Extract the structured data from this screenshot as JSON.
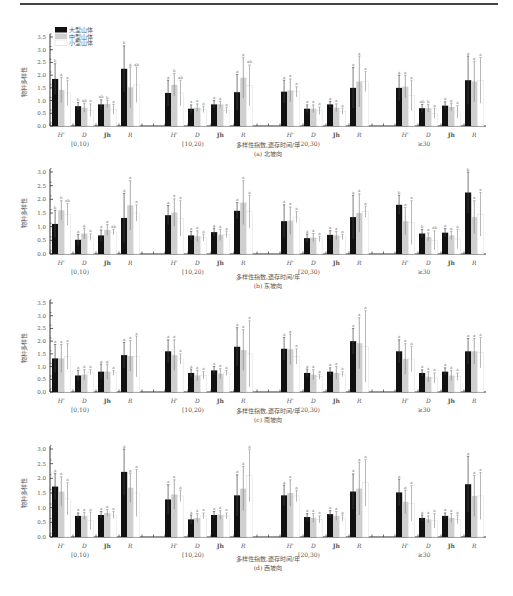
{
  "legend": {
    "items": [
      {
        "label": "大型山体",
        "color": "#111111"
      },
      {
        "label": "中型山体",
        "color": "#cfcfcf"
      },
      {
        "label": "小型山体",
        "color": "#ffffff"
      }
    ]
  },
  "chart_data": [
    {
      "type": "bar",
      "title": "(a) 北坡向",
      "xlabel": "多样性指数,遗存时间/年",
      "ylabel": "物种多样性",
      "ylim": [
        0,
        3.5
      ],
      "yticks": [
        "0.0",
        "0.5",
        "1.0",
        "1.5",
        "2.0",
        "2.5",
        "3.0",
        "3.5"
      ],
      "groups": [
        "[0,10)",
        "[10,20)",
        "[20,30)",
        "≥30"
      ],
      "categories": [
        "H'",
        "D",
        "Jh",
        "R"
      ],
      "series": [
        {
          "name": "大型山体",
          "values": [
            [
              1.85,
              0.78,
              0.85,
              2.25
            ],
            [
              1.3,
              0.68,
              0.85,
              1.33
            ],
            [
              1.35,
              0.68,
              0.85,
              1.5
            ],
            [
              1.5,
              0.7,
              0.8,
              1.8
            ]
          ],
          "errors": [
            [
              0.6,
              0.15,
              0.18,
              0.9
            ],
            [
              0.5,
              0.15,
              0.15,
              0.7
            ],
            [
              0.45,
              0.15,
              0.12,
              0.8
            ],
            [
              0.5,
              0.15,
              0.15,
              0.95
            ]
          ]
        },
        {
          "name": "中型山体",
          "values": [
            [
              1.42,
              0.72,
              0.87,
              1.52
            ],
            [
              1.62,
              0.72,
              0.85,
              1.9
            ],
            [
              1.4,
              0.68,
              0.72,
              1.75
            ],
            [
              1.55,
              0.7,
              0.75,
              1.75
            ]
          ],
          "errors": [
            [
              0.5,
              0.18,
              0.15,
              0.8
            ],
            [
              0.45,
              0.15,
              0.12,
              0.8
            ],
            [
              0.45,
              0.15,
              0.15,
              1.0
            ],
            [
              0.45,
              0.15,
              0.15,
              0.8
            ]
          ]
        },
        {
          "name": "小型山体",
          "values": [
            [
              1.3,
              0.62,
              0.65,
              1.62
            ],
            [
              1.3,
              0.65,
              0.62,
              1.6
            ],
            [
              1.35,
              0.6,
              0.58,
              1.75
            ],
            [
              1.2,
              0.5,
              0.55,
              1.8
            ]
          ],
          "errors": [
            [
              0.5,
              0.25,
              0.2,
              0.7
            ],
            [
              0.5,
              0.12,
              0.12,
              0.8
            ],
            [
              0.2,
              0.15,
              0.12,
              0.4
            ],
            [
              0.6,
              0.2,
              0.25,
              0.9
            ]
          ]
        }
      ],
      "significance": [
        [
          [
            "b",
            "a",
            "a"
          ],
          [
            "b",
            "ab",
            "a"
          ],
          [
            "ab",
            "b",
            "a"
          ],
          [
            "b",
            "a",
            "ab"
          ]
        ],
        [
          [
            "a",
            "b",
            "ab"
          ],
          [
            "a",
            "a",
            "a"
          ],
          [
            "a",
            "a",
            "a"
          ],
          [
            "a",
            "a",
            "ab"
          ]
        ],
        [
          [
            "a",
            "a",
            "a"
          ],
          [
            "a",
            "a",
            "a"
          ],
          [
            "a",
            "a",
            "a"
          ],
          [
            "a",
            "a",
            "a"
          ]
        ],
        [
          [
            "a",
            "a",
            "a"
          ],
          [
            "ab",
            "b",
            "a"
          ],
          [
            "a",
            "a",
            "a"
          ],
          [
            "a",
            "a",
            "a"
          ]
        ]
      ]
    },
    {
      "type": "bar",
      "title": "(b) 东坡向",
      "xlabel": "多样性指数,遗存时间/年",
      "ylabel": "物种多样性",
      "ylim": [
        0,
        3.0
      ],
      "yticks": [
        "0.0",
        "0.5",
        "1.0",
        "1.5",
        "2.0",
        "2.5",
        "3.0"
      ],
      "groups": [
        "[0,10)",
        "[10,20)",
        "[20,30)",
        "≥30"
      ],
      "categories": [
        "H'",
        "D",
        "Jh",
        "R"
      ],
      "series": [
        {
          "name": "大型山体",
          "values": [
            [
              1.1,
              0.52,
              0.68,
              1.32
            ],
            [
              1.42,
              0.68,
              0.8,
              1.58
            ],
            [
              1.2,
              0.58,
              0.7,
              1.35
            ],
            [
              1.8,
              0.75,
              0.78,
              2.25
            ]
          ],
          "errors": [
            [
              0.5,
              0.2,
              0.2,
              0.9
            ],
            [
              0.35,
              0.15,
              0.15,
              0.3
            ],
            [
              0.6,
              0.15,
              0.15,
              0.8
            ],
            [
              0.35,
              0.15,
              0.15,
              0.75
            ]
          ]
        },
        {
          "name": "中型山体",
          "values": [
            [
              1.6,
              0.75,
              0.88,
              1.78
            ],
            [
              1.52,
              0.65,
              0.7,
              1.88
            ],
            [
              1.22,
              0.6,
              0.68,
              1.5
            ],
            [
              1.2,
              0.62,
              0.68,
              1.35
            ]
          ],
          "errors": [
            [
              0.35,
              0.2,
              0.2,
              0.9
            ],
            [
              0.5,
              0.2,
              0.2,
              0.8
            ],
            [
              0.5,
              0.15,
              0.15,
              0.7
            ],
            [
              0.5,
              0.15,
              0.15,
              0.6
            ]
          ]
        },
        {
          "name": "小型山体",
          "values": [
            [
              1.45,
              0.62,
              0.8,
              1.5
            ],
            [
              1.3,
              0.6,
              0.72,
              1.55
            ],
            [
              1.35,
              0.55,
              0.62,
              1.55
            ],
            [
              1.15,
              0.5,
              0.55,
              1.45
            ]
          ],
          "errors": [
            [
              0.4,
              0.12,
              0.1,
              0.3
            ],
            [
              0.65,
              0.12,
              0.12,
              0.6
            ],
            [
              0.2,
              0.1,
              0.1,
              0.2
            ],
            [
              0.8,
              0.35,
              0.35,
              0.8
            ]
          ]
        }
      ],
      "significance": [
        [
          [
            "b",
            "b",
            "ab"
          ],
          [
            "a",
            "a",
            "a"
          ],
          [
            "a",
            "a",
            "ab"
          ],
          [
            "a",
            "a",
            "a"
          ]
        ],
        [
          [
            "a",
            "a",
            "a"
          ],
          [
            "a",
            "a",
            "a"
          ],
          [
            "a",
            "a",
            "a"
          ],
          [
            "a",
            "a",
            "a"
          ]
        ],
        [
          [
            "a",
            "a",
            "a"
          ],
          [
            "a",
            "a",
            "a"
          ],
          [
            "a",
            "a",
            "a"
          ],
          [
            "a",
            "a",
            "a"
          ]
        ],
        [
          [
            "b",
            "a",
            "a"
          ],
          [
            "b",
            "a",
            "ab"
          ],
          [
            "a",
            "a",
            "a"
          ],
          [
            "b",
            "a",
            "a"
          ]
        ]
      ]
    },
    {
      "type": "bar",
      "title": "(c) 南坡向",
      "xlabel": "多样性指数,遗存时间/年",
      "ylabel": "物种多样性",
      "ylim": [
        0,
        3.5
      ],
      "yticks": [
        "0.0",
        "0.5",
        "1.0",
        "1.5",
        "2.0",
        "2.5",
        "3.0",
        "3.5"
      ],
      "groups": [
        "[0,10)",
        "[10,20)",
        "[20,30)",
        "≥30"
      ],
      "categories": [
        "H'",
        "D",
        "Jh",
        "R"
      ],
      "series": [
        {
          "name": "大型山体",
          "values": [
            [
              1.32,
              0.65,
              0.8,
              1.45
            ],
            [
              1.6,
              0.75,
              0.85,
              1.78
            ],
            [
              1.7,
              0.75,
              0.8,
              2.0
            ],
            [
              1.6,
              0.75,
              0.8,
              1.6
            ]
          ],
          "errors": [
            [
              0.55,
              0.2,
              0.3,
              0.5
            ],
            [
              0.45,
              0.15,
              0.15,
              0.75
            ],
            [
              0.45,
              0.15,
              0.15,
              0.5
            ],
            [
              0.45,
              0.12,
              0.15,
              0.5
            ]
          ]
        },
        {
          "name": "中型山体",
          "values": [
            [
              1.32,
              0.68,
              0.8,
              1.42
            ],
            [
              1.45,
              0.65,
              0.72,
              1.65
            ],
            [
              1.68,
              0.68,
              0.75,
              1.92
            ],
            [
              1.3,
              0.6,
              0.65,
              1.6
            ]
          ],
          "errors": [
            [
              0.55,
              0.2,
              0.3,
              0.6
            ],
            [
              0.6,
              0.2,
              0.2,
              0.8
            ],
            [
              0.6,
              0.2,
              0.25,
              1.0
            ],
            [
              0.6,
              0.2,
              0.2,
              0.5
            ]
          ]
        },
        {
          "name": "小型山体",
          "values": [
            [
              1.4,
              0.78,
              0.75,
              1.4
            ],
            [
              1.3,
              0.65,
              0.75,
              1.5
            ],
            [
              1.4,
              0.6,
              0.7,
              1.8
            ],
            [
              1.3,
              0.55,
              0.6,
              1.55
            ]
          ],
          "errors": [
            [
              0.5,
              0.1,
              0.1,
              0.8
            ],
            [
              0.2,
              0.15,
              0.1,
              1.3
            ],
            [
              0.3,
              0.1,
              0.1,
              1.4
            ],
            [
              0.5,
              0.2,
              0.15,
              0.6
            ]
          ]
        }
      ],
      "significance": [
        [
          [
            "a",
            "a",
            "a"
          ],
          [
            "a",
            "a",
            "a"
          ],
          [
            "a",
            "a",
            "a"
          ],
          [
            "a",
            "a",
            "a"
          ]
        ],
        [
          [
            "a",
            "a",
            "a"
          ],
          [
            "a",
            "a",
            "a"
          ],
          [
            "a",
            "a",
            "a"
          ],
          [
            "a",
            "a",
            "a"
          ]
        ],
        [
          [
            "a",
            "a",
            "a"
          ],
          [
            "a",
            "a",
            "a"
          ],
          [
            "a",
            "a",
            "a"
          ],
          [
            "a",
            "a",
            "a"
          ]
        ],
        [
          [
            "a",
            "a",
            "a"
          ],
          [
            "a",
            "a",
            "a"
          ],
          [
            "a",
            "a",
            "a"
          ],
          [
            "a",
            "a",
            "a"
          ]
        ]
      ]
    },
    {
      "type": "bar",
      "title": "(d) 西坡向",
      "xlabel": "多样性指数,遗存时间/年",
      "ylabel": "物种多样性",
      "ylim": [
        0,
        3.0
      ],
      "yticks": [
        "0.0",
        "0.5",
        "1.0",
        "1.5",
        "2.0",
        "2.5",
        "3.0"
      ],
      "groups": [
        "[0,10)",
        "[10,20)",
        "[20,30)",
        "≥30"
      ],
      "categories": [
        "H'",
        "D",
        "Jh",
        "R"
      ],
      "series": [
        {
          "name": "大型山体",
          "values": [
            [
              1.72,
              0.72,
              0.75,
              2.22
            ],
            [
              1.28,
              0.6,
              0.75,
              1.42
            ],
            [
              1.42,
              0.68,
              0.78,
              1.55
            ],
            [
              1.52,
              0.65,
              0.72,
              1.8
            ]
          ],
          "errors": [
            [
              0.45,
              0.1,
              0.12,
              0.8
            ],
            [
              0.5,
              0.15,
              0.12,
              0.7
            ],
            [
              0.35,
              0.12,
              0.12,
              0.6
            ],
            [
              0.45,
              0.1,
              0.1,
              0.95
            ]
          ]
        },
        {
          "name": "中型山体",
          "values": [
            [
              1.55,
              0.72,
              0.82,
              1.68
            ],
            [
              1.45,
              0.65,
              0.75,
              1.65
            ],
            [
              1.5,
              0.65,
              0.72,
              1.65
            ],
            [
              1.2,
              0.6,
              0.65,
              1.4
            ]
          ],
          "errors": [
            [
              0.5,
              0.12,
              0.12,
              0.5
            ],
            [
              0.5,
              0.15,
              0.15,
              0.75
            ],
            [
              0.45,
              0.15,
              0.15,
              0.9
            ],
            [
              0.4,
              0.12,
              0.15,
              0.7
            ]
          ]
        },
        {
          "name": "小型山体",
          "values": [
            [
              1.3,
              0.55,
              0.75,
              1.5
            ],
            [
              1.4,
              0.72,
              0.72,
              2.1
            ],
            [
              1.4,
              0.6,
              0.65,
              1.85
            ],
            [
              1.15,
              0.55,
              0.6,
              1.4
            ]
          ],
          "errors": [
            [
              0.55,
              0.3,
              0.12,
              0.8
            ],
            [
              0.2,
              0.1,
              0.1,
              0.9
            ],
            [
              0.2,
              0.12,
              0.1,
              0.8
            ],
            [
              0.6,
              0.25,
              0.15,
              0.8
            ]
          ]
        }
      ],
      "significance": [
        [
          [
            "a",
            "a",
            "a"
          ],
          [
            "a",
            "a",
            "a"
          ],
          [
            "a",
            "a",
            "a"
          ],
          [
            "a",
            "a",
            "a"
          ]
        ],
        [
          [
            "a",
            "a",
            "a"
          ],
          [
            "a",
            "a",
            "a"
          ],
          [
            "a",
            "a",
            "a"
          ],
          [
            "a",
            "a",
            "a"
          ]
        ],
        [
          [
            "a",
            "a",
            "a"
          ],
          [
            "a",
            "a",
            "a"
          ],
          [
            "a",
            "a",
            "a"
          ],
          [
            "a",
            "a",
            "a"
          ]
        ],
        [
          [
            "a",
            "a",
            "a"
          ],
          [
            "a",
            "a",
            "a"
          ],
          [
            "a",
            "a",
            "a"
          ],
          [
            "a",
            "a",
            "a"
          ]
        ]
      ]
    }
  ],
  "panels": [
    {
      "top": 22,
      "plot_top": 37,
      "plot_bottom": 126,
      "caption_y1": 147,
      "caption_y2": 156
    },
    {
      "top": 165,
      "plot_top": 172,
      "plot_bottom": 254,
      "caption_y1": 279,
      "caption_y2": 288
    },
    {
      "top": 300,
      "plot_top": 303,
      "plot_bottom": 392,
      "caption_y1": 413,
      "caption_y2": 422
    },
    {
      "top": 445,
      "plot_top": 449,
      "plot_bottom": 537,
      "caption_y1": 561,
      "caption_y2": 570
    }
  ]
}
